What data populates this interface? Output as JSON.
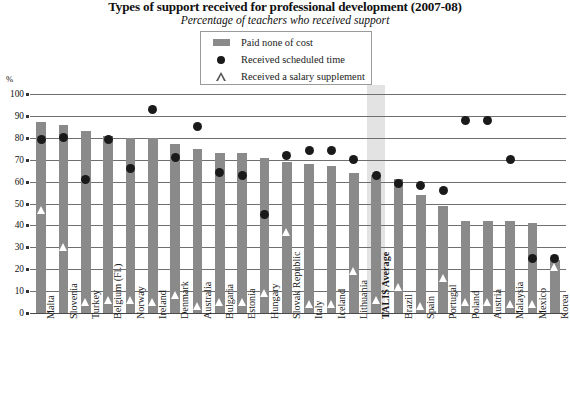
{
  "chart_data": {
    "type": "bar",
    "title": "Types of support received for professional development (2007-08)",
    "subtitle": "Percentage of teachers who received support",
    "xlabel": "",
    "ylabel": "%",
    "ylim": [
      0,
      100
    ],
    "ytick_step": 10,
    "yticks": [
      0,
      10,
      20,
      30,
      40,
      50,
      60,
      70,
      80,
      90,
      100
    ],
    "grid": true,
    "legend_position": "top-center",
    "legend": [
      {
        "key": "bar",
        "label": "Paid none of cost"
      },
      {
        "key": "dot",
        "label": "Received scheduled time"
      },
      {
        "key": "triangle",
        "label": "Received a salary supplement"
      }
    ],
    "categories": [
      "Malta",
      "Slovenia",
      "Turkey",
      "Belgium (Fl.)",
      "Norway",
      "Ireland",
      "Denmark",
      "Australia",
      "Bulgaria",
      "Estonia",
      "Hungary",
      "Slovak Republic",
      "Italy",
      "Iceland",
      "Lithuania",
      "TALIS Average",
      "Brazil",
      "Spain",
      "Portugal",
      "Poland",
      "Austria",
      "Malaysia",
      "Mexico",
      "Korea"
    ],
    "highlight_category": "TALIS Average",
    "series": [
      {
        "name": "Paid none of cost",
        "type": "bar",
        "values": [
          87,
          86,
          83,
          81,
          80,
          80,
          77,
          75,
          73,
          73,
          71,
          69,
          68,
          67,
          64,
          63,
          61,
          54,
          49,
          42,
          42,
          42,
          41,
          24
        ]
      },
      {
        "name": "Received scheduled time",
        "type": "dot",
        "values": [
          79,
          80,
          61,
          79,
          66,
          93,
          71,
          85,
          64,
          63,
          45,
          72,
          74,
          74,
          70,
          63,
          59,
          58,
          56,
          88,
          88,
          70,
          25,
          25
        ]
      },
      {
        "name": "Received a salary supplement",
        "type": "triangle",
        "values": [
          47,
          30,
          5,
          6,
          6,
          5,
          8,
          3,
          5,
          5,
          9,
          37,
          4,
          4,
          19,
          6,
          12,
          3,
          16,
          5,
          5,
          4,
          4,
          21
        ]
      }
    ]
  }
}
